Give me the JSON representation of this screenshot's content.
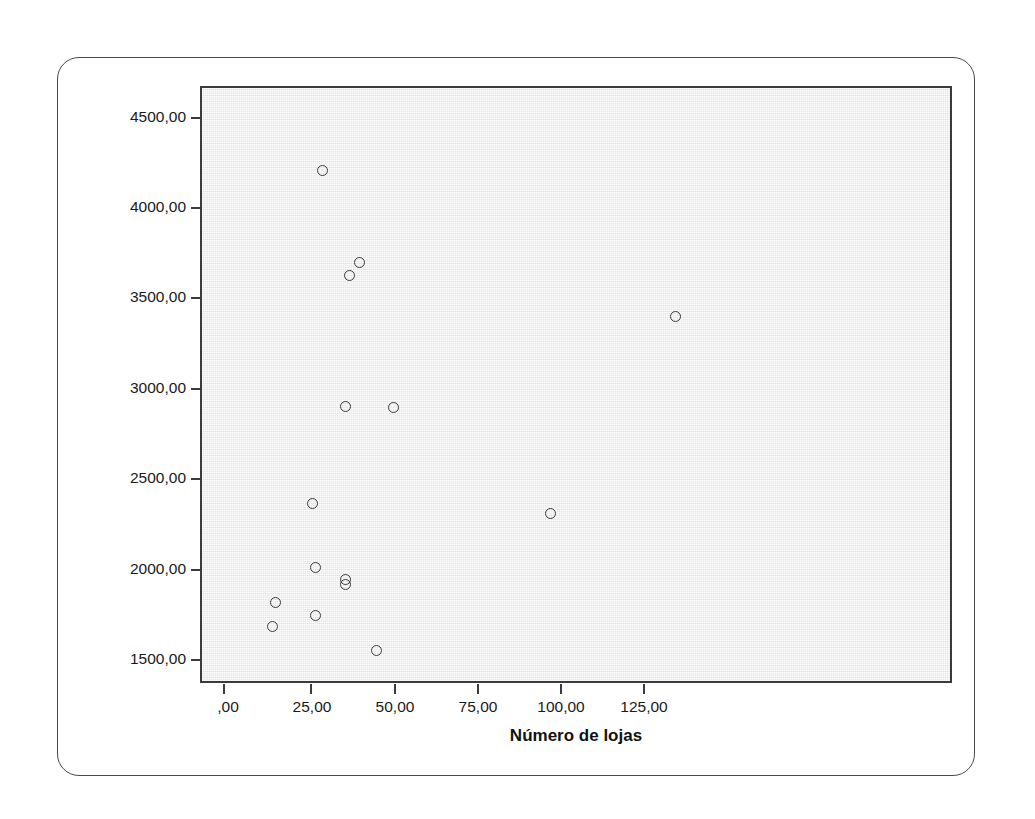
{
  "chart_data": {
    "type": "scatter",
    "title": "",
    "xlabel": "Número de lojas",
    "ylabel": "Faturamento (R$ milhões)",
    "xlim": [
      -6,
      219
    ],
    "ylim": [
      1340,
      4660
    ],
    "grid": false,
    "legend": "none",
    "marker": {
      "shape": "open-circle",
      "edge_color": "#3a3a3a",
      "fill": "none",
      "size_px": 11
    },
    "panel_background": "#e9e9e9",
    "xticks": [
      0,
      25,
      50,
      75,
      100,
      125
    ],
    "xticklabels": [
      ",00",
      "25,00",
      "50,00",
      "75,00",
      "100,00",
      "125,00"
    ],
    "yticks": [
      1500,
      2000,
      2500,
      3000,
      3500,
      4000,
      4500
    ],
    "yticklabels": [
      "1500,00",
      "2000,00",
      "2500,00",
      "3000,00",
      "3500,00",
      "4000,00",
      "4500,00"
    ],
    "points": [
      {
        "x": 29,
        "y": 4215
      },
      {
        "x": 37,
        "y": 3635
      },
      {
        "x": 40,
        "y": 3705
      },
      {
        "x": 36,
        "y": 2910
      },
      {
        "x": 50,
        "y": 2905
      },
      {
        "x": 134,
        "y": 3405
      },
      {
        "x": 26,
        "y": 2370
      },
      {
        "x": 97,
        "y": 2315
      },
      {
        "x": 27,
        "y": 2020
      },
      {
        "x": 36,
        "y": 1950
      },
      {
        "x": 36,
        "y": 1925
      },
      {
        "x": 15,
        "y": 1825
      },
      {
        "x": 27,
        "y": 1750
      },
      {
        "x": 14,
        "y": 1690
      },
      {
        "x": 45,
        "y": 1560
      }
    ]
  },
  "axes": {
    "x_title": "Número de lojas",
    "y_title": "Faturamento (R$ milhões)",
    "x_tick_labels": [
      ",00",
      "25,00",
      "50,00",
      "75,00",
      "100,00",
      "125,00"
    ],
    "y_tick_labels": [
      "4500,00",
      "4000,00",
      "3500,00",
      "3000,00",
      "2500,00",
      "2000,00",
      "1500,00"
    ]
  },
  "colors": {
    "panel": "#e9e9e9",
    "frame": "#3b3b3b",
    "marker_edge": "#3a3a3a",
    "card_border": "#4a4a4a",
    "text": "#111111"
  }
}
